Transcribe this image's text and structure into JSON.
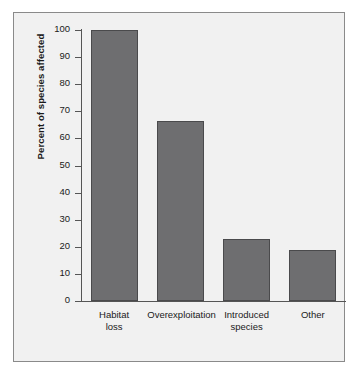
{
  "chart_data": {
    "type": "bar",
    "title": "",
    "subtitle": "",
    "xlabel": "",
    "ylabel": "Percent of species affected",
    "categories": [
      "Habitat loss",
      "Overexploitation",
      "Introduced species",
      "Other"
    ],
    "category_lines": [
      [
        "Habitat",
        "loss"
      ],
      [
        "Overexploitation",
        ""
      ],
      [
        "Introduced",
        "species"
      ],
      [
        "Other",
        ""
      ]
    ],
    "values": [
      100,
      66.5,
      23,
      19
    ],
    "ylim": [
      0,
      100
    ],
    "ytick_labels": [
      "100",
      "90",
      "80",
      "70",
      "60",
      "50",
      "40",
      "30",
      "20",
      "10",
      "0"
    ],
    "ytick_values": [
      100,
      90,
      80,
      70,
      60,
      50,
      40,
      30,
      20,
      10,
      0
    ],
    "grid": false,
    "legend": "none",
    "colors": {
      "bar_fill": "#6e6e70",
      "bar_border": "#4a4a4c",
      "plot_background": "#f1f1f1",
      "frame_border": "#8a8a8a",
      "axis_line": "#555555",
      "text": "#1a1a1a",
      "page_background": "#ffffff"
    }
  }
}
